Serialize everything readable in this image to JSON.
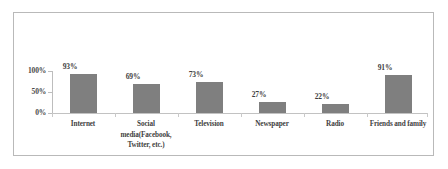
{
  "chart_data": {
    "type": "bar",
    "title": "",
    "xlabel": "",
    "ylabel": "",
    "categories": [
      "Internet",
      "Social media(Facebook, Twitter, etc.)",
      "Television",
      "Newspaper",
      "Radio",
      "Friends and family"
    ],
    "values": [
      93,
      69,
      73,
      27,
      22,
      91
    ],
    "value_labels": [
      "93%",
      "69%",
      "73%",
      "27%",
      "22%",
      "91%"
    ],
    "ylim": [
      0,
      100
    ],
    "ytick_values": [
      0,
      50,
      100
    ],
    "ytick_labels": [
      "0%",
      "50%",
      "100%"
    ],
    "grid": false,
    "legend": null,
    "bar_color": "#7f7f7f",
    "axis_color": "#bdbdbd",
    "frame_color": "#b9b9b9",
    "background": "#ffffff"
  },
  "category_label_lines": [
    [
      "Internet"
    ],
    [
      "Social",
      "media(Facebook,",
      "Twitter, etc.)"
    ],
    [
      "Television"
    ],
    [
      "Newspaper"
    ],
    [
      "Radio"
    ],
    [
      "Friends and family"
    ]
  ]
}
